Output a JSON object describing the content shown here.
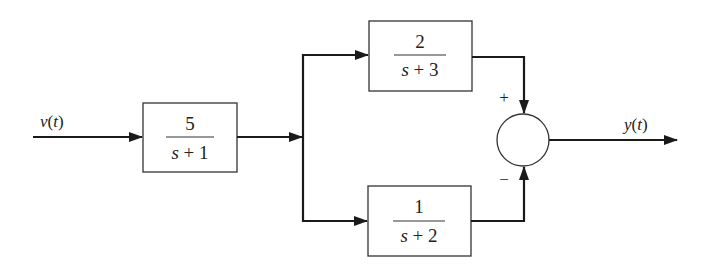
{
  "diagram": {
    "type": "block-diagram",
    "input_signal": {
      "label_var": "v",
      "label_arg": "(",
      "label_t": "t",
      "label_close": ")"
    },
    "output_signal": {
      "label_var": "y",
      "label_arg": "(",
      "label_t": "t",
      "label_close": ")"
    },
    "blocks": [
      {
        "id": "G1",
        "numerator": "5",
        "denominator_var": "s",
        "denominator_rest": "+ 1"
      },
      {
        "id": "G2",
        "numerator": "2",
        "denominator_var": "s",
        "denominator_rest": "+ 3"
      },
      {
        "id": "G3",
        "numerator": "1",
        "denominator_var": "s",
        "denominator_rest": "+ 2"
      }
    ],
    "summing_junction": {
      "top_sign": "+",
      "bottom_sign": "−"
    },
    "colors": {
      "line": "#1a1a1a",
      "text": "#222222",
      "background": "#ffffff"
    }
  }
}
